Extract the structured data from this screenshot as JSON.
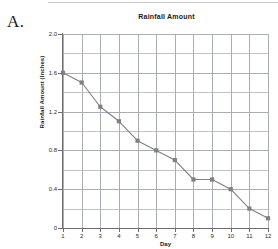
{
  "figure": {
    "label": "A."
  },
  "chart_data": {
    "type": "line",
    "title": "Rainfall Amount",
    "xlabel": "Day",
    "ylabel": "Rainfall Amount (Inches)",
    "x": [
      1,
      2,
      3,
      4,
      5,
      6,
      7,
      8,
      9,
      10,
      11,
      12
    ],
    "values": [
      1.6,
      1.5,
      1.25,
      1.1,
      0.9,
      0.8,
      0.7,
      0.5,
      0.5,
      0.4,
      0.2,
      0.1
    ],
    "categories": [
      "1",
      "2",
      "3",
      "4",
      "5",
      "6",
      "7",
      "8",
      "9",
      "10",
      "11",
      "12"
    ],
    "xtick_labels": [
      "1",
      "2",
      "3",
      "4",
      "5",
      "6",
      "7",
      "8",
      "9",
      "10",
      "11",
      "12"
    ],
    "ytick_labels": [
      "2.0",
      "1.6",
      "1.2",
      "0.8",
      "0.4",
      "0"
    ],
    "ytick_values": [
      2.0,
      1.6,
      1.2,
      0.8,
      0.4,
      0
    ],
    "ylim": [
      0,
      2.0
    ],
    "xlim": [
      1,
      12
    ],
    "grid": true,
    "grid_minor_step": 0.2,
    "legend": false,
    "series_color": "#808080",
    "marker": "square",
    "grid_color": "#bfc4cc",
    "axis_color": "#6d6d6d"
  }
}
